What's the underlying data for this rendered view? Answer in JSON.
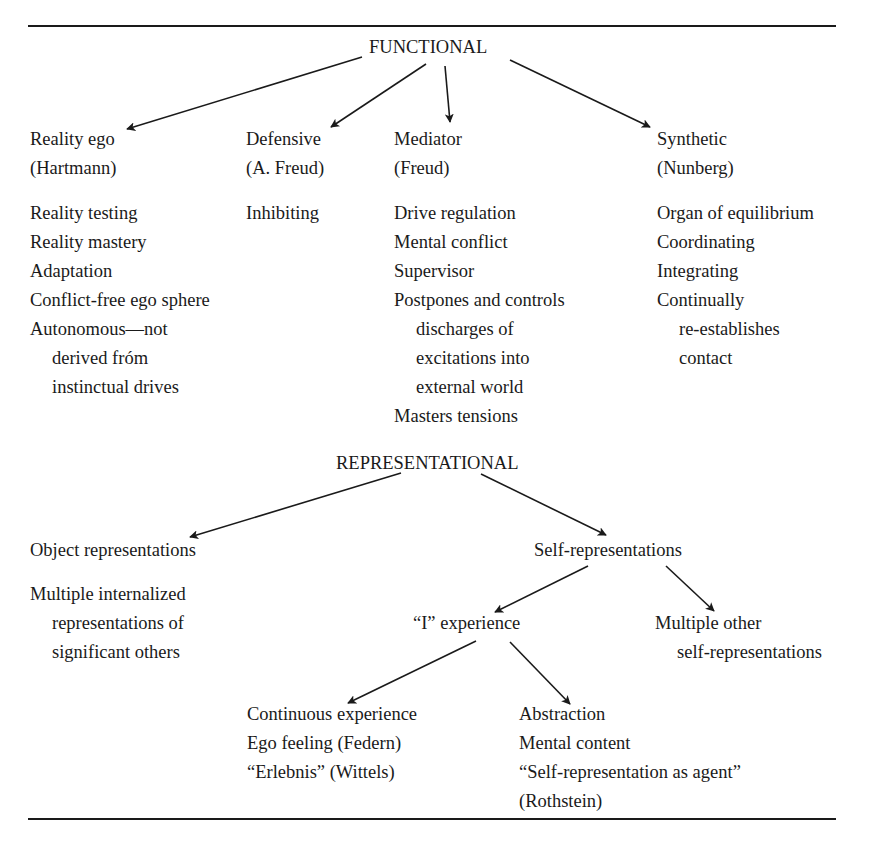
{
  "functional": {
    "title": "FUNCTIONAL",
    "branches": [
      {
        "title": "Reality ego",
        "author": "(Hartmann)",
        "items": [
          "Reality testing",
          "Reality mastery",
          "Adaptation",
          "Conflict-free ego sphere",
          "Autonomous—not",
          "derived fróm",
          "instinctual drives"
        ]
      },
      {
        "title": "Defensive",
        "author": "(A. Freud)",
        "items": [
          "Inhibiting"
        ]
      },
      {
        "title": "Mediator",
        "author": "(Freud)",
        "items": [
          "Drive regulation",
          "Mental conflict",
          "Supervisor",
          "Postpones and controls",
          "discharges of",
          "excitations into",
          "external world",
          "Masters tensions"
        ]
      },
      {
        "title": "Synthetic",
        "author": "(Nunberg)",
        "items": [
          "Organ of equilibrium",
          "Coordinating",
          "Integrating",
          "Continually",
          "re-establishes",
          "contact"
        ]
      }
    ]
  },
  "representational": {
    "title": "REPRESENTATIONAL",
    "object": {
      "title": "Object representations",
      "items": [
        "Multiple internalized",
        "representations of",
        "significant others"
      ]
    },
    "self": {
      "title": "Self-representations",
      "i_experience": {
        "title": "“I” experience",
        "continuous": [
          "Continuous experience",
          "Ego feeling (Federn)",
          "“Erlebnis” (Wittels)"
        ],
        "abstraction": [
          "Abstraction",
          "Mental content",
          "“Self-representation as agent”",
          "(Rothstein)"
        ]
      },
      "multiple_other": [
        "Multiple other",
        "self-representations"
      ]
    }
  },
  "colors": {
    "ink": "#1a1a1a",
    "background": "#ffffff"
  }
}
